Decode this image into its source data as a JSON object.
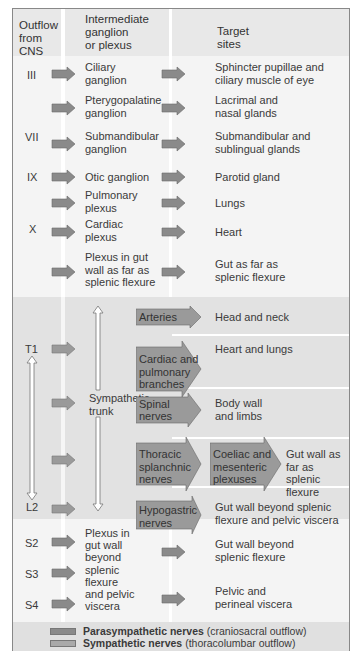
{
  "header": {
    "col1": "Outflow from CNS",
    "col1_lines": [
      "Outflow",
      "from",
      "CNS"
    ],
    "col2_lines": [
      "Intermediate",
      "ganglion",
      "or plexus"
    ],
    "col3_lines": [
      "Target",
      "sites"
    ]
  },
  "parasympathetic_cranial": [
    {
      "outflow": "III",
      "ganglion": [
        "Ciliary",
        "ganglion"
      ],
      "target": [
        "Sphincter pupillae and",
        "ciliary muscle of eye"
      ]
    },
    {
      "outflow": "VII",
      "ganglion": [
        "Pterygopalatine",
        "ganglion"
      ],
      "target": [
        "Lacrimal and",
        "nasal glands"
      ]
    },
    {
      "outflow": "",
      "ganglion": [
        "Submandibular",
        "ganglion"
      ],
      "target": [
        "Submandibular and",
        "sublingual glands"
      ]
    },
    {
      "outflow": "IX",
      "ganglion": [
        "Otic ganglion"
      ],
      "target": [
        "Parotid gland"
      ]
    },
    {
      "outflow": "",
      "ganglion": [
        "Pulmonary",
        "plexus"
      ],
      "target": [
        "Lungs"
      ]
    },
    {
      "outflow": "X",
      "ganglion": [
        "Cardiac",
        "plexus"
      ],
      "target": [
        "Heart"
      ]
    },
    {
      "outflow": "",
      "ganglion": [
        "Plexus in gut",
        "wall as far as",
        "splenic flexure"
      ],
      "target": [
        "Gut as far as",
        "splenic flexure"
      ]
    }
  ],
  "sympathetic": {
    "outflow_top": "T1",
    "outflow_bottom": "L2",
    "trunk_label": [
      "Sympathetic",
      "trunk"
    ],
    "branches": [
      {
        "nerve": [
          "Arteries"
        ],
        "target": [
          "Head and neck"
        ]
      },
      {
        "nerve": [
          "Cardiac and",
          "pulmonary",
          "branches"
        ],
        "target": [
          "Heart and lungs"
        ]
      },
      {
        "nerve": [
          "Spinal nerves"
        ],
        "target": [
          "Body wall",
          "and limbs"
        ]
      },
      {
        "nerve": [
          "Thoracic",
          "splanchnic",
          "nerves"
        ],
        "plexus": [
          "Coeliac and",
          "mesenteric",
          "plexuses"
        ],
        "target": [
          "Gut wall as",
          "far as splenic",
          "flexure"
        ]
      },
      {
        "nerve": [
          "Hypogastric",
          "nerves"
        ],
        "target": [
          "Gut wall beyond splenic",
          "flexure and pelvic viscera"
        ]
      }
    ]
  },
  "parasympathetic_sacral": {
    "outflows": [
      "S2",
      "S3",
      "S4"
    ],
    "plexus": [
      "Plexus in",
      "gut wall",
      "beyond",
      "splenic",
      "flexure",
      "and pelvic",
      "viscera"
    ],
    "targets": [
      [
        "Gut wall beyond",
        "splenic flexure"
      ],
      [
        "Pelvic and",
        "perineal viscera"
      ]
    ]
  },
  "legend": [
    {
      "bold": "Parasympathetic nerves",
      "rest": " (craniosacral outflow)",
      "color": "#8a8a8a"
    },
    {
      "bold": "Sympathetic nerves",
      "rest": " (thoracolumbar outflow)",
      "color": "#a9a9a9"
    }
  ],
  "colors": {
    "para_arrow": "#8a8a8a",
    "symp_arrow": "#9a9a9a",
    "band_symp": "#e2e2e2",
    "band_para": "#f3f3f3",
    "border": "#888888"
  }
}
